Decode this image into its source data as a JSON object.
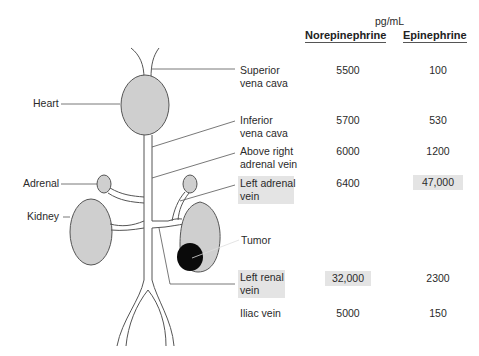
{
  "units": "pg/mL",
  "columns": [
    "Norepinephrine",
    "Epinephrine"
  ],
  "anatomy_labels": {
    "heart": "Heart",
    "adrenal": "Adrenal",
    "kidney": "Kidney",
    "tumor": "Tumor"
  },
  "rows": [
    {
      "site_line1": "Superior",
      "site_line2": "vena cava",
      "norepinephrine": "5500",
      "epinephrine": "100",
      "site_highlight": false,
      "ne_highlight": false,
      "epi_highlight": false
    },
    {
      "site_line1": "Inferior",
      "site_line2": "vena cava",
      "norepinephrine": "5700",
      "epinephrine": "530",
      "site_highlight": false,
      "ne_highlight": false,
      "epi_highlight": false
    },
    {
      "site_line1": "Above right",
      "site_line2": "adrenal vein",
      "norepinephrine": "6000",
      "epinephrine": "1200",
      "site_highlight": false,
      "ne_highlight": false,
      "epi_highlight": false
    },
    {
      "site_line1": "Left adrenal",
      "site_line2": "vein",
      "norepinephrine": "6400",
      "epinephrine": "47,000",
      "site_highlight": true,
      "ne_highlight": false,
      "epi_highlight": true
    },
    {
      "site_line1": "Left renal",
      "site_line2": "vein",
      "norepinephrine": "32,000",
      "epinephrine": "2300",
      "site_highlight": true,
      "ne_highlight": true,
      "epi_highlight": false
    },
    {
      "site_line1": "Iliac vein",
      "site_line2": "",
      "norepinephrine": "5000",
      "epinephrine": "150",
      "site_highlight": false,
      "ne_highlight": false,
      "epi_highlight": false
    }
  ],
  "colors": {
    "organ_fill": "#cfcfcf",
    "tumor_fill": "#0a0a0a",
    "highlight": "#e4e4e4",
    "line": "#555555"
  }
}
